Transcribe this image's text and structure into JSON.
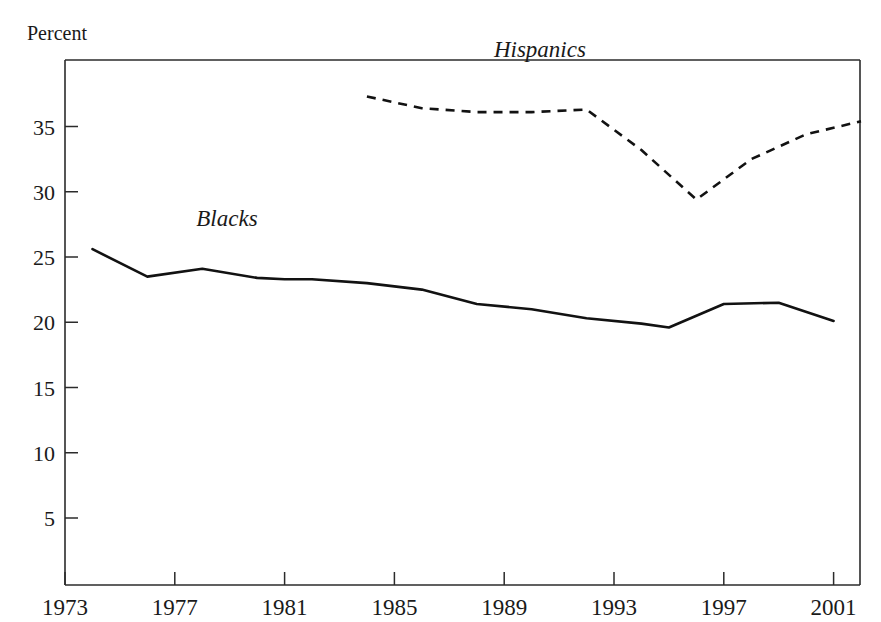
{
  "chart_data": {
    "type": "line",
    "title": "",
    "subtitle": "",
    "xlabel": "",
    "ylabel": "Percent",
    "xlim": [
      1973,
      2002
    ],
    "ylim": [
      0,
      38.5
    ],
    "grid": false,
    "legend_position": "inline-annotation",
    "x_ticks": [
      "1973",
      "1977",
      "1981",
      "1985",
      "1989",
      "1993",
      "1997",
      "2001"
    ],
    "x_tick_values": [
      1973,
      1977,
      1981,
      1985,
      1989,
      1993,
      1997,
      2001
    ],
    "y_ticks": [
      "5",
      "10",
      "15",
      "20",
      "25",
      "30",
      "35"
    ],
    "y_tick_values": [
      5,
      10,
      15,
      20,
      25,
      30,
      35
    ],
    "annotations": [
      {
        "text": "Blacks",
        "x": 1978.9,
        "y": 27.4,
        "style": "italic"
      },
      {
        "text": "Hispanics",
        "x": 1990.3,
        "y": 40.3,
        "style": "italic"
      }
    ],
    "series": [
      {
        "name": "Blacks",
        "label": "Blacks",
        "style": "solid",
        "color": "#121212",
        "x": [
          1974,
          1976,
          1978,
          1980,
          1981,
          1982,
          1984,
          1986,
          1988,
          1990,
          1992,
          1994,
          1995,
          1997,
          1999,
          2001
        ],
        "values": [
          25.6,
          23.5,
          24.1,
          23.4,
          23.3,
          23.3,
          23.0,
          22.5,
          21.4,
          21.0,
          20.3,
          19.9,
          19.6,
          21.4,
          21.5,
          20.1
        ]
      },
      {
        "name": "Hispanics",
        "label": "Hispanics",
        "style": "dashed",
        "color": "#121212",
        "x": [
          1984,
          1986,
          1988,
          1990,
          1992,
          1994,
          1996,
          1998,
          2000,
          2002
        ],
        "values": [
          37.3,
          36.4,
          36.1,
          36.1,
          36.3,
          33.2,
          29.4,
          32.5,
          34.4,
          35.4
        ]
      }
    ]
  },
  "axis": {
    "y_title": "Percent"
  }
}
